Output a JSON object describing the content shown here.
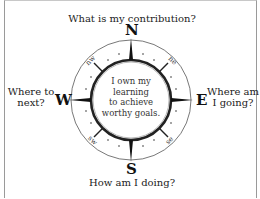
{
  "diagram": {
    "type": "compass",
    "questions": {
      "north": "What is my contribution?",
      "east": [
        "Where am",
        "I going?"
      ],
      "south": "How am I doing?",
      "west": [
        "Where to",
        "next?"
      ]
    },
    "directions": {
      "north": "N",
      "east": "E",
      "south": "S",
      "west": "W",
      "northeast": "ne",
      "southeast": "se",
      "southwest": "sw",
      "northwest": "nw"
    },
    "center_text": [
      "I own my",
      "learning",
      "to achieve",
      "worthy goals."
    ],
    "colors": {
      "ink": "#111111",
      "ring": "#555555",
      "frame": "#9a9a9a"
    }
  }
}
